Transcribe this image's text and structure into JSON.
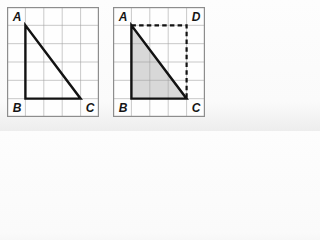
{
  "figure": {
    "grid": {
      "columns": 5,
      "rows": 6
    },
    "panels": [
      {
        "name": "left",
        "labels": {
          "A": "A",
          "B": "B",
          "C": "C"
        }
      },
      {
        "name": "right",
        "labels": {
          "A": "A",
          "B": "B",
          "C": "C",
          "D": "D"
        }
      }
    ]
  },
  "colors": {
    "triangle_fill": "#d8d8d8",
    "line": "#121212",
    "grid_line": "#9f9f9f",
    "panel_border": "#8d8d8d",
    "paper": "#fefefe"
  }
}
